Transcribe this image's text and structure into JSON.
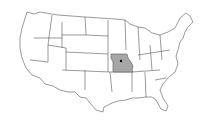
{
  "map": {
    "region": "United States (contiguous)",
    "highlighted_state": "Missouri",
    "marker": "state capital",
    "colors": {
      "background": "#ffffff",
      "state_fill": "#ffffff",
      "state_border": "#555555",
      "highlight_fill": "#a6a6a6",
      "marker": "#000000"
    }
  }
}
